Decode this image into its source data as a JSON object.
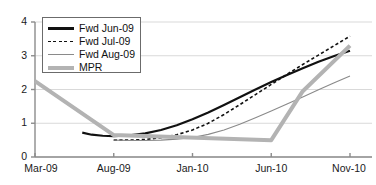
{
  "chart_data": {
    "type": "line",
    "title": "",
    "xlabel": "",
    "ylabel": "",
    "ylim": [
      0,
      4
    ],
    "yticks": [
      0,
      1,
      2,
      3,
      4
    ],
    "grid": true,
    "legend_position": "upper-left-inside",
    "x_tick_labels": [
      "Mar-09",
      "Aug-09",
      "Jan-10",
      "Jun-10",
      "Nov-10"
    ],
    "x_tick_values": [
      0,
      5,
      10,
      15,
      20
    ],
    "x_axis_unit": "months from Mar-09",
    "xlim": [
      0,
      20
    ],
    "series": [
      {
        "name": "Fwd Jun-09",
        "style": "solid",
        "color": "#111111",
        "width": 2.2,
        "x": [
          3,
          3.6,
          4.3,
          5,
          6,
          7,
          8,
          9,
          10,
          11,
          12,
          13,
          14,
          15,
          16,
          17,
          18,
          19,
          20
        ],
        "values": [
          0.72,
          0.66,
          0.63,
          0.62,
          0.64,
          0.7,
          0.8,
          0.94,
          1.12,
          1.32,
          1.54,
          1.77,
          2.0,
          2.22,
          2.43,
          2.63,
          2.82,
          2.99,
          3.15
        ]
      },
      {
        "name": "Fwd Jul-09",
        "style": "dashed",
        "color": "#111111",
        "width": 1.6,
        "x": [
          5,
          6,
          7,
          8,
          9,
          10,
          11,
          12,
          13,
          14,
          15,
          16,
          17,
          18,
          19,
          20
        ],
        "values": [
          0.5,
          0.5,
          0.52,
          0.57,
          0.66,
          0.8,
          1.0,
          1.26,
          1.55,
          1.85,
          2.15,
          2.45,
          2.74,
          3.02,
          3.3,
          3.58
        ]
      },
      {
        "name": "Fwd Aug-09",
        "style": "solid",
        "color": "#8a8a8a",
        "width": 1.1,
        "x": [
          5,
          6,
          7,
          8,
          9,
          10,
          11,
          12,
          13,
          14,
          15,
          16,
          17,
          18,
          19,
          20
        ],
        "values": [
          0.5,
          0.49,
          0.49,
          0.5,
          0.53,
          0.58,
          0.67,
          0.8,
          0.97,
          1.16,
          1.36,
          1.57,
          1.78,
          1.99,
          2.2,
          2.4
        ]
      },
      {
        "name": "MPR",
        "style": "solid",
        "color": "#b3b3b3",
        "width": 4.0,
        "x": [
          0,
          5,
          15,
          17,
          20
        ],
        "values": [
          2.25,
          0.65,
          0.5,
          1.95,
          3.3
        ]
      }
    ]
  },
  "legend": {
    "entries": [
      {
        "label": "Fwd Jun-09",
        "style": "solid",
        "color": "#111111",
        "width": 2.2
      },
      {
        "label": "Fwd Jul-09",
        "style": "dashed",
        "color": "#111111",
        "width": 1.6
      },
      {
        "label": "Fwd Aug-09",
        "style": "solid",
        "color": "#8a8a8a",
        "width": 1.3
      },
      {
        "label": "MPR",
        "style": "solid",
        "color": "#b3b3b3",
        "width": 4.0
      }
    ]
  },
  "axes": {
    "y_tick_labels": [
      "0",
      "1",
      "2",
      "3",
      "4"
    ],
    "x_tick_labels": [
      "Mar-09",
      "Aug-09",
      "Jan-10",
      "Jun-10",
      "Nov-10"
    ]
  },
  "colors": {
    "axis": "#8c8c8c",
    "grid": "#d9d9d9",
    "text": "#1a1a1a",
    "black_series": "#111111",
    "gray_series": "#8a8a8a",
    "mpr_series": "#b3b3b3"
  }
}
